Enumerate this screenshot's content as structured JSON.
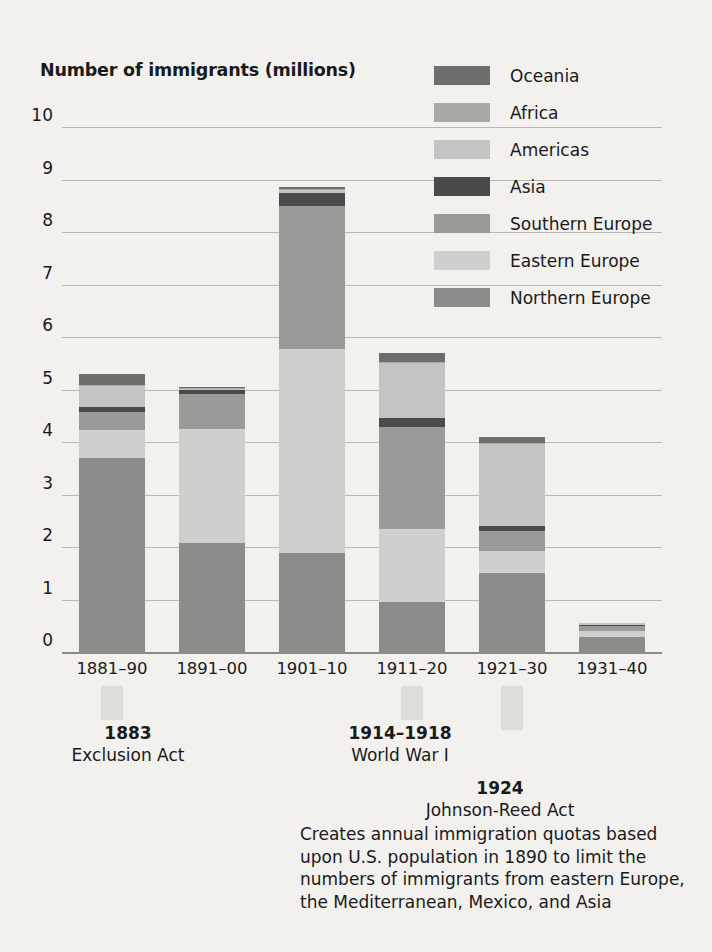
{
  "chart_data": {
    "type": "bar",
    "subtype": "stacked-bar",
    "title": "Number of immigrants (millions)",
    "xlabel": "",
    "ylabel": "Number of immigrants (millions)",
    "ylim": [
      0,
      10
    ],
    "ytick_values": [
      0,
      1,
      2,
      3,
      4,
      5,
      6,
      7,
      8,
      9,
      10
    ],
    "ytick_labels": [
      "0",
      "1",
      "2",
      "3",
      "4",
      "5",
      "6",
      "7",
      "8",
      "9",
      "10"
    ],
    "grid": true,
    "legend_position": "top-right",
    "categories": [
      "1881–90",
      "1891–00",
      "1901–10",
      "1911–20",
      "1921–30",
      "1931–40"
    ],
    "series": [
      {
        "name": "Northern Europe",
        "color": "#8b8b89",
        "values": [
          3.7,
          2.08,
          1.88,
          0.96,
          1.5,
          0.28
        ]
      },
      {
        "name": "Eastern Europe",
        "color": "#cfcfcd",
        "values": [
          0.52,
          2.16,
          3.9,
          1.38,
          0.42,
          0.12
        ]
      },
      {
        "name": "Southern Europe",
        "color": "#9a9a98",
        "values": [
          0.36,
          0.68,
          2.72,
          1.95,
          0.38,
          0.1
        ]
      },
      {
        "name": "Asia",
        "color": "#4a4a4a",
        "values": [
          0.08,
          0.07,
          0.25,
          0.17,
          0.11,
          0.02
        ]
      },
      {
        "name": "Americas",
        "color": "#c4c4c2",
        "values": [
          0.4,
          0.03,
          0.05,
          1.05,
          1.55,
          0.03
        ]
      },
      {
        "name": "Africa",
        "color": "#a8a8a6",
        "values": [
          0.02,
          0.01,
          0.02,
          0.02,
          0.02,
          0.0
        ]
      },
      {
        "name": "Oceania",
        "color": "#6e6e6c",
        "values": [
          0.22,
          0.02,
          0.03,
          0.17,
          0.12,
          0.0
        ]
      }
    ],
    "totals": [
      5.3,
      5.05,
      8.85,
      5.7,
      4.1,
      0.55
    ],
    "annotations": [
      {
        "year": "1883",
        "title": "Exclusion Act",
        "body": ""
      },
      {
        "year": "1914–1918",
        "title": "World  War I",
        "body": ""
      },
      {
        "year": "1924",
        "title": "Johnson-Reed Act",
        "body": "Creates annual immigration quotas based upon U.S. population in 1890 to limit the numbers of immigrants from eastern Europe, the Mediterranean, Mexico, and Asia"
      }
    ]
  },
  "legend": {
    "items": [
      {
        "label": "Oceania",
        "color": "#6e6e6c"
      },
      {
        "label": "Africa",
        "color": "#a8a8a6"
      },
      {
        "label": "Americas",
        "color": "#c4c4c2"
      },
      {
        "label": "Asia",
        "color": "#4a4a4a"
      },
      {
        "label": "Southern  Europe",
        "color": "#9a9a98"
      },
      {
        "label": "Eastern Europe",
        "color": "#cfcfcd"
      },
      {
        "label": "Northern Europe",
        "color": "#8b8b89"
      }
    ]
  },
  "annotations": {
    "a1": {
      "year": "1883",
      "title": "Exclusion Act"
    },
    "a2": {
      "year": "1914–1918",
      "title": "World  War I"
    },
    "a3": {
      "year": "1924",
      "title": "Johnson-Reed Act",
      "body": "Creates annual immigration quotas based upon U.S. population in 1890 to limit the numbers of immigrants from eastern Europe, the Mediterranean, Mexico, and Asia"
    }
  }
}
